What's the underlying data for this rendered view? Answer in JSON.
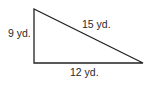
{
  "figure": {
    "type": "right-triangle",
    "sides": {
      "vertical": {
        "label": "9 yd.",
        "length": 9,
        "unit": "yd."
      },
      "hypotenuse": {
        "label": "15 yd.",
        "length": 15,
        "unit": "yd."
      },
      "horizontal": {
        "label": "12 yd.",
        "length": 12,
        "unit": "yd."
      }
    },
    "stroke_color": "#222222"
  }
}
